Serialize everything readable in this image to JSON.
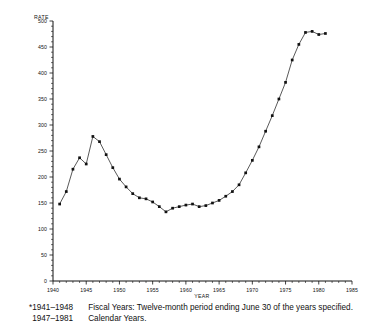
{
  "chart_data": {
    "type": "line",
    "title": "",
    "xlabel": "YEAR",
    "ylabel": "RATE",
    "xlim": [
      1940,
      1985
    ],
    "ylim": [
      0,
      500
    ],
    "grid": false,
    "legend": false,
    "y_ticks": [
      0,
      50,
      100,
      150,
      200,
      250,
      300,
      350,
      400,
      450,
      500
    ],
    "y_tick_labels": [
      "0",
      "50",
      "100",
      "150",
      "200",
      "250",
      "300",
      "350",
      "400",
      "450",
      "500"
    ],
    "x_ticks": [
      1940,
      1945,
      1950,
      1955,
      1960,
      1965,
      1970,
      1975,
      1980,
      1985
    ],
    "x_tick_labels": [
      "1940",
      "1945",
      "1950",
      "1955",
      "1960",
      "1965",
      "1970",
      "1975",
      "1980",
      "1985"
    ],
    "marker": "filled-square",
    "x": [
      1941,
      1942,
      1943,
      1944,
      1945,
      1946,
      1947,
      1948,
      1949,
      1950,
      1951,
      1952,
      1953,
      1954,
      1955,
      1956,
      1957,
      1958,
      1959,
      1960,
      1961,
      1962,
      1963,
      1964,
      1965,
      1966,
      1967,
      1968,
      1969,
      1970,
      1971,
      1972,
      1973,
      1974,
      1975,
      1976,
      1977,
      1978,
      1979,
      1980,
      1981
    ],
    "values": [
      148,
      172,
      215,
      237,
      225,
      278,
      268,
      243,
      218,
      196,
      181,
      168,
      160,
      158,
      152,
      143,
      133,
      140,
      143,
      146,
      148,
      143,
      145,
      150,
      155,
      163,
      172,
      185,
      208,
      232,
      258,
      288,
      318,
      350,
      382,
      425,
      455,
      478,
      480,
      474,
      476
    ],
    "series_name": "RATE"
  },
  "axis": {
    "y_label": "RATE",
    "x_label": "YEAR"
  },
  "footnote": {
    "asterisk": "*",
    "line1_years": "1941–1948",
    "line1_text": "Fiscal Years: Twelve-month period ending June 30 of the years specified.",
    "line2_years": "1947–1981",
    "line2_text": "Calendar Years."
  }
}
